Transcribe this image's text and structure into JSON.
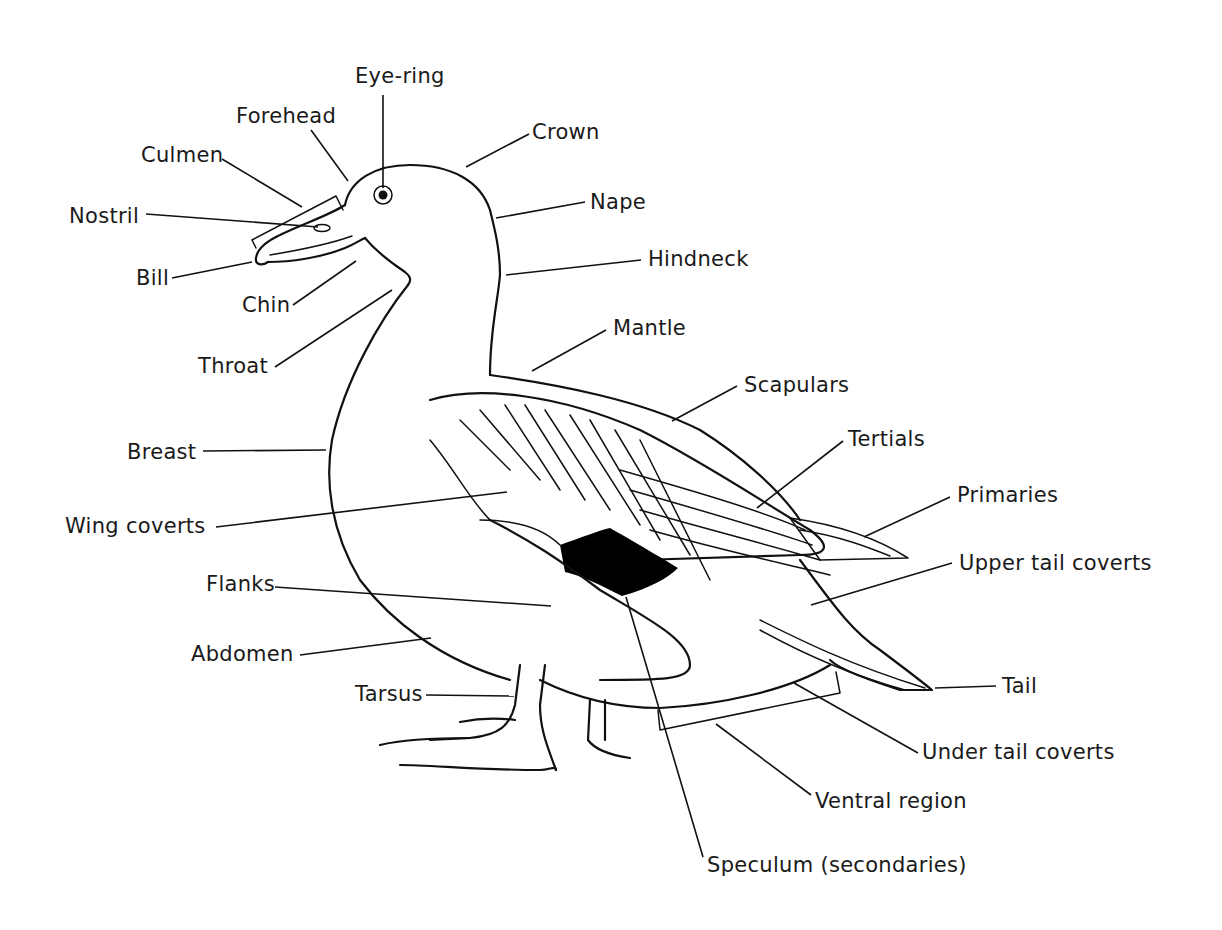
{
  "diagram": {
    "colors": {
      "ink": "#111111",
      "background": "#ffffff",
      "speculum": "#000000"
    },
    "labels": [
      {
        "id": "eye-ring",
        "text": "Eye-ring",
        "x": 355,
        "y": 66,
        "line": [
          383,
          95,
          383,
          188
        ]
      },
      {
        "id": "forehead",
        "text": "Forehead",
        "x": 236,
        "y": 106,
        "line": [
          311,
          130,
          348,
          181
        ]
      },
      {
        "id": "crown",
        "text": "Crown",
        "x": 532,
        "y": 122,
        "line": [
          529,
          134,
          466,
          167
        ]
      },
      {
        "id": "culmen",
        "text": "Culmen",
        "x": 141,
        "y": 145,
        "line": [
          222,
          159,
          302,
          207
        ]
      },
      {
        "id": "nape",
        "text": "Nape",
        "x": 590,
        "y": 192,
        "line": [
          585,
          202,
          496,
          218
        ]
      },
      {
        "id": "nostril",
        "text": "Nostril",
        "x": 69,
        "y": 206,
        "line": [
          146,
          214,
          318,
          227
        ]
      },
      {
        "id": "hindneck",
        "text": "Hindneck",
        "x": 648,
        "y": 249,
        "line": [
          641,
          260,
          506,
          275
        ]
      },
      {
        "id": "bill",
        "text": "Bill",
        "x": 136,
        "y": 268,
        "line": [
          172,
          278,
          252,
          262
        ]
      },
      {
        "id": "chin",
        "text": "Chin",
        "x": 242,
        "y": 295,
        "line": [
          293,
          305,
          356,
          261
        ]
      },
      {
        "id": "mantle",
        "text": "Mantle",
        "x": 613,
        "y": 318,
        "line": [
          606,
          330,
          532,
          371
        ]
      },
      {
        "id": "throat",
        "text": "Throat",
        "x": 198,
        "y": 356,
        "line": [
          275,
          367,
          392,
          290
        ]
      },
      {
        "id": "scapulars",
        "text": "Scapulars",
        "x": 744,
        "y": 375,
        "line": [
          737,
          386,
          672,
          421
        ]
      },
      {
        "id": "tertials",
        "text": "Tertials",
        "x": 848,
        "y": 429,
        "line": [
          843,
          441,
          757,
          508
        ]
      },
      {
        "id": "breast",
        "text": "Breast",
        "x": 127,
        "y": 442,
        "line": [
          203,
          451,
          326,
          450
        ]
      },
      {
        "id": "primaries",
        "text": "Primaries",
        "x": 957,
        "y": 485,
        "line": [
          950,
          497,
          864,
          537
        ]
      },
      {
        "id": "wing-coverts",
        "text": "Wing coverts",
        "x": 65,
        "y": 516,
        "line": [
          216,
          527,
          507,
          492
        ]
      },
      {
        "id": "upper-tail-coverts",
        "text": "Upper tail coverts",
        "x": 959,
        "y": 553,
        "line": [
          952,
          563,
          811,
          605
        ]
      },
      {
        "id": "flanks",
        "text": "Flanks",
        "x": 206,
        "y": 574,
        "line": [
          275,
          587,
          551,
          606
        ]
      },
      {
        "id": "abdomen",
        "text": "Abdomen",
        "x": 191,
        "y": 644,
        "line": [
          300,
          655,
          431,
          638
        ]
      },
      {
        "id": "tail",
        "text": "Tail",
        "x": 1002,
        "y": 676,
        "line": [
          996,
          686,
          935,
          688
        ]
      },
      {
        "id": "tarsus",
        "text": "Tarsus",
        "x": 355,
        "y": 684,
        "line": [
          426,
          695,
          514,
          696
        ]
      },
      {
        "id": "under-tail-coverts",
        "text": "Under tail coverts",
        "x": 922,
        "y": 742,
        "line": [
          918,
          753,
          794,
          683
        ]
      },
      {
        "id": "ventral-region",
        "text": "Ventral region",
        "x": 815,
        "y": 791,
        "line": [
          811,
          795,
          716,
          724
        ]
      },
      {
        "id": "speculum",
        "text": "Speculum (secondaries)",
        "x": 707,
        "y": 855,
        "line": [
          703,
          857,
          626,
          597
        ]
      }
    ]
  }
}
